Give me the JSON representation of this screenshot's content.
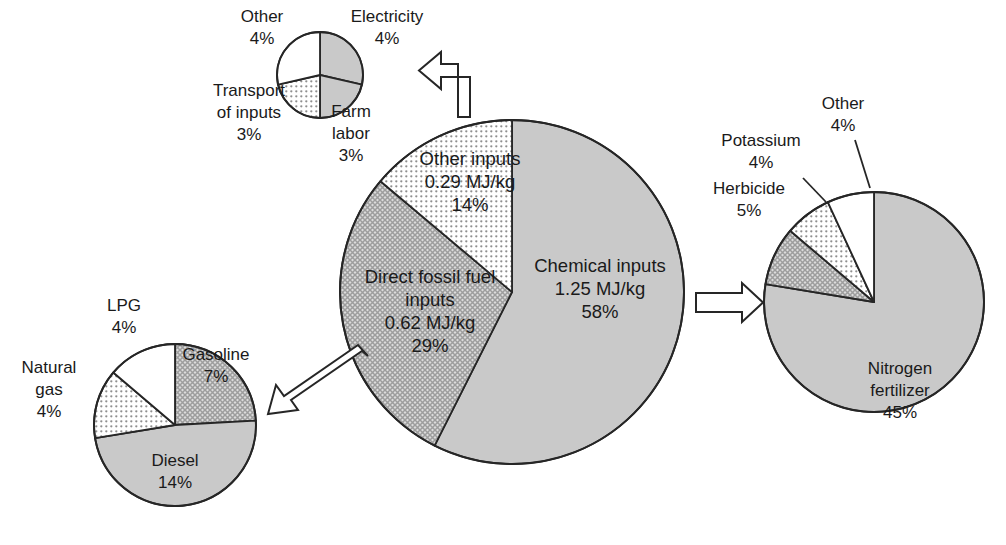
{
  "figure": {
    "background": "#ffffff",
    "stroke": "#262626",
    "text_color": "#1a1a1a"
  },
  "fills": {
    "solid_gray": "#c9c9c9",
    "crosshatch_gray": "#cfcfcf",
    "dotted_light": "#f2f2f2",
    "white": "#ffffff",
    "dot_color": "#8a8a8a",
    "hatch_color": "#9a9a9a"
  },
  "arrows": {
    "top": {
      "name": "arrow-up-left-bent",
      "direction": "up-then-left"
    },
    "left": {
      "name": "arrow-down-left-diagonal",
      "direction": "down-left"
    },
    "right": {
      "name": "arrow-right",
      "direction": "right"
    }
  },
  "chart_data": [
    {
      "id": "main",
      "type": "pie",
      "title": "Energy inputs breakdown",
      "center": [
        512,
        292
      ],
      "radius": 172,
      "start_angle": 0,
      "clockwise": true,
      "slices": [
        {
          "label": "Chemical inputs",
          "value_text": "1.25 MJ/kg",
          "percent": 58,
          "fill": "solid_gray",
          "label_xy": [
            600,
            272
          ]
        },
        {
          "label": "Direct fossil fuel inputs",
          "value_text": "0.62 MJ/kg",
          "percent": 29,
          "fill": "crosshatch_gray",
          "label_xy": [
            430,
            290
          ]
        },
        {
          "label": "Other inputs",
          "value_text": "0.29 MJ/kg",
          "percent": 14,
          "fill": "dotted_light",
          "label_xy": [
            468,
            165
          ]
        }
      ],
      "labels": [
        {
          "lines": [
            "Chemical inputs",
            "1.25 MJ/kg",
            "58%"
          ],
          "x": 600,
          "y": 272,
          "anchor": "middle"
        },
        {
          "lines": [
            "Direct fossil fuel",
            "inputs",
            "0.62 MJ/kg",
            "29%"
          ],
          "x": 430,
          "y": 283,
          "anchor": "middle"
        },
        {
          "lines": [
            "Other inputs",
            "0.29 MJ/kg",
            "14%"
          ],
          "x": 470,
          "y": 165,
          "anchor": "middle"
        }
      ]
    },
    {
      "id": "other-inputs",
      "type": "pie",
      "title": "Other inputs detail",
      "center": [
        320,
        75
      ],
      "radius": 43,
      "start_angle": 0,
      "clockwise": true,
      "slices": [
        {
          "label": "Electricity",
          "percent": 4,
          "fill": "solid_gray"
        },
        {
          "label": "Farm labor",
          "percent": 3,
          "fill": "solid_gray"
        },
        {
          "label": "Transport of inputs",
          "percent": 3,
          "fill": "dotted_light"
        },
        {
          "label": "Other",
          "percent": 4,
          "fill": "white"
        }
      ],
      "labels": [
        {
          "lines": [
            "Electricity",
            "4%"
          ],
          "x": 387,
          "y": 22,
          "anchor": "middle"
        },
        {
          "lines": [
            "Farm",
            "labor",
            "3%"
          ],
          "x": 351,
          "y": 117,
          "anchor": "middle"
        },
        {
          "lines": [
            "Transport",
            "of inputs",
            "3%"
          ],
          "x": 249,
          "y": 96,
          "anchor": "middle"
        },
        {
          "lines": [
            "Other",
            "4%"
          ],
          "x": 262,
          "y": 22,
          "anchor": "middle"
        }
      ]
    },
    {
      "id": "fossil-fuel",
      "type": "pie",
      "title": "Direct fossil fuel inputs detail",
      "center": [
        175,
        425
      ],
      "radius": 81,
      "start_angle": 0,
      "clockwise": true,
      "slices": [
        {
          "label": "Gasoline",
          "percent": 7,
          "fill": "crosshatch_gray"
        },
        {
          "label": "Diesel",
          "percent": 14,
          "fill": "solid_gray"
        },
        {
          "label": "Natural gas",
          "percent": 4,
          "fill": "dotted_light"
        },
        {
          "label": "LPG",
          "percent": 4,
          "fill": "white"
        }
      ],
      "labels": [
        {
          "lines": [
            "Gasoline",
            "7%"
          ],
          "x": 216,
          "y": 360,
          "anchor": "middle"
        },
        {
          "lines": [
            "Diesel",
            "14%"
          ],
          "x": 175,
          "y": 466,
          "anchor": "middle"
        },
        {
          "lines": [
            "Natural",
            "gas",
            "4%"
          ],
          "x": 49,
          "y": 373,
          "anchor": "middle"
        },
        {
          "lines": [
            "LPG",
            "4%"
          ],
          "x": 124,
          "y": 311,
          "anchor": "middle"
        }
      ]
    },
    {
      "id": "chemical",
      "type": "pie",
      "title": "Chemical inputs detail",
      "center": [
        874,
        302
      ],
      "radius": 110,
      "start_angle": 0,
      "clockwise": true,
      "slices": [
        {
          "label": "Nitrogen fertilizer",
          "percent": 45,
          "fill": "solid_gray"
        },
        {
          "label": "Herbicide",
          "percent": 5,
          "fill": "crosshatch_gray"
        },
        {
          "label": "Potassium",
          "percent": 4,
          "fill": "dotted_light"
        },
        {
          "label": "Other",
          "percent": 4,
          "fill": "white"
        }
      ],
      "labels": [
        {
          "lines": [
            "Nitrogen",
            "fertilizer",
            "45%"
          ],
          "x": 900,
          "y": 374,
          "anchor": "middle"
        },
        {
          "lines": [
            "Herbicide",
            "5%"
          ],
          "x": 749,
          "y": 194,
          "anchor": "middle"
        },
        {
          "lines": [
            "Potassium",
            "4%"
          ],
          "x": 761,
          "y": 146,
          "anchor": "middle"
        },
        {
          "lines": [
            "Other",
            "4%"
          ],
          "x": 843,
          "y": 109,
          "anchor": "middle"
        }
      ],
      "leaders": [
        {
          "name": "leader-potassium",
          "x1": 803,
          "y1": 178,
          "x2": 826,
          "y2": 202
        },
        {
          "name": "leader-other",
          "x1": 855,
          "y1": 140,
          "x2": 870,
          "y2": 188
        }
      ]
    }
  ]
}
